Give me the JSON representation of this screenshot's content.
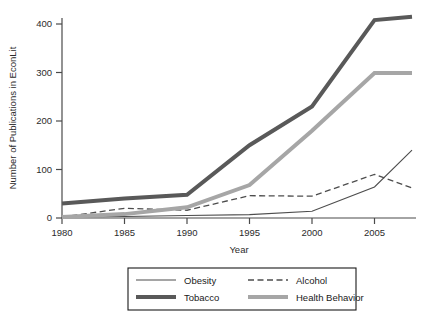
{
  "chart_data": {
    "type": "line",
    "title": "",
    "xlabel": "Year",
    "ylabel": "Number of Publications in EconLit",
    "xlim": [
      1980,
      2008
    ],
    "ylim": [
      0,
      430
    ],
    "xticks": [
      1980,
      1985,
      1990,
      1995,
      2000,
      2005
    ],
    "yticks": [
      0,
      100,
      200,
      300,
      400
    ],
    "xtick_labels": [
      "1980",
      "1985",
      "1990",
      "1995",
      "2000",
      "2005"
    ],
    "ytick_labels": [
      "0",
      "100",
      "200",
      "300",
      "400"
    ],
    "grid": false,
    "legend_position": "bottom",
    "x": [
      1980,
      1985,
      1990,
      1995,
      2000,
      2005,
      2008
    ],
    "series": [
      {
        "name": "Obesity",
        "style": "thin-solid",
        "color": "#4d4d4d",
        "width": 1.1,
        "values": [
          2,
          3,
          5,
          7,
          14,
          64,
          140
        ]
      },
      {
        "name": "Alcohol",
        "style": "dashed",
        "color": "#4d4d4d",
        "width": 1.3,
        "values": [
          2,
          20,
          16,
          46,
          45,
          90,
          62
        ]
      },
      {
        "name": "Tobacco",
        "style": "thick-solid",
        "color": "#595959",
        "width": 4.0,
        "values": [
          30,
          40,
          48,
          150,
          230,
          408,
          415
        ]
      },
      {
        "name": "Health Behavior",
        "style": "thick-solid",
        "color": "#a6a6a6",
        "width": 4.0,
        "values": [
          2,
          8,
          22,
          68,
          180,
          299,
          299
        ]
      }
    ]
  },
  "legend": {
    "entries": [
      {
        "label": "Obesity",
        "swatch": "thin-solid-dark"
      },
      {
        "label": "Alcohol",
        "swatch": "dashed-dark"
      },
      {
        "label": "Tobacco",
        "swatch": "thick-solid-dark"
      },
      {
        "label": "Health Behavior",
        "swatch": "thick-solid-gray"
      }
    ]
  },
  "colors": {
    "axis": "#4a4a4a",
    "text": "#1a1a1a",
    "obesity": "#4d4d4d",
    "alcohol": "#4d4d4d",
    "tobacco": "#595959",
    "health_behavior": "#a6a6a6",
    "background": "#ffffff"
  }
}
